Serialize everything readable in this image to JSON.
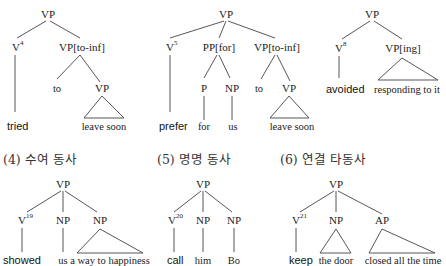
{
  "trees": [
    {
      "id": "tried",
      "nodes": {
        "root": "VP",
        "v": "V",
        "v_sup": "4",
        "comp": "VP[to-inf]",
        "to": "to",
        "vp": "VP"
      },
      "words": {
        "verb": "tried",
        "vp_yield": "leave soon"
      }
    },
    {
      "id": "prefer",
      "nodes": {
        "root": "VP",
        "v": "V",
        "v_sup": "5",
        "pp": "PP[for]",
        "p": "P",
        "np": "NP",
        "comp": "VP[to-inf]",
        "to": "to",
        "vp": "VP"
      },
      "words": {
        "verb": "prefer",
        "p": "for",
        "np": "us",
        "vp_yield": "leave soon"
      }
    },
    {
      "id": "avoided",
      "nodes": {
        "root": "VP",
        "v": "V",
        "v_sup": "8",
        "comp": "VP[ing]"
      },
      "words": {
        "verb": "avoided",
        "comp_yield": "responding to it"
      }
    },
    {
      "id": "ditransitive",
      "title": "(4) 수여 동사",
      "nodes": {
        "root": "VP",
        "v": "V",
        "v_sup": "19",
        "np1": "NP",
        "np2": "NP"
      },
      "words": {
        "verb": "showed",
        "np1": "us",
        "np2_yield": "a way to happiness"
      }
    },
    {
      "id": "naming",
      "title": "(5) 명명 동사",
      "nodes": {
        "root": "VP",
        "v": "V",
        "v_sup": "20",
        "np1": "NP",
        "np2": "NP"
      },
      "words": {
        "verb": "call",
        "np1": "him",
        "np2": "Bo"
      }
    },
    {
      "id": "linking",
      "title": "(6) 연결 타동사",
      "nodes": {
        "root": "VP",
        "v": "V",
        "v_sup": "21",
        "np": "NP",
        "ap": "AP"
      },
      "words": {
        "verb": "keep",
        "np_yield": "the door",
        "ap_yield": "closed all the time"
      }
    }
  ]
}
